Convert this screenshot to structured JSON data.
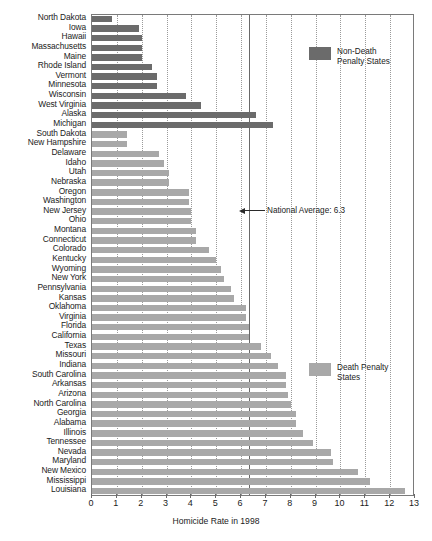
{
  "chart_data": {
    "type": "bar",
    "orientation": "horizontal",
    "title": "",
    "xlabel": "Homicide Rate in 1998",
    "ylabel": "",
    "xlim": [
      0,
      13
    ],
    "xticks": [
      0,
      1,
      2,
      3,
      4,
      5,
      6,
      7,
      8,
      9,
      10,
      11,
      12,
      13
    ],
    "grid": true,
    "legend_position": "inside-right",
    "series": [
      {
        "name": "Non-Death Penalty States",
        "color": "#6b6b6b"
      },
      {
        "name": "Death Penalty States",
        "color": "#a8a8a8"
      }
    ],
    "categories": [
      "North Dakota",
      "Iowa",
      "Hawaii",
      "Massachusetts",
      "Maine",
      "Rhode Island",
      "Vermont",
      "Minnesota",
      "Wisconsin",
      "West Virginia",
      "Alaska",
      "Michigan",
      "South Dakota",
      "New Hampshire",
      "Delaware",
      "Idaho",
      "Utah",
      "Nebraska",
      "Oregon",
      "Washington",
      "New Jersey",
      "Ohio",
      "Montana",
      "Connecticut",
      "Colorado",
      "Kentucky",
      "Wyoming",
      "New York",
      "Pennsylvania",
      "Kansas",
      "Oklahoma",
      "Virginia",
      "Florida",
      "California",
      "Texas",
      "Missouri",
      "Indiana",
      "South Carolina",
      "Arkansas",
      "Arizona",
      "North Carolina",
      "Georgia",
      "Alabama",
      "Illinois",
      "Tennessee",
      "Nevada",
      "Maryland",
      "New Mexico",
      "Mississippi",
      "Louisiana"
    ],
    "values": [
      0.8,
      1.9,
      2.0,
      2.0,
      2.0,
      2.4,
      2.6,
      2.6,
      3.8,
      4.4,
      6.6,
      7.3,
      1.4,
      1.4,
      2.7,
      2.9,
      3.1,
      3.1,
      3.9,
      3.9,
      4.0,
      4.0,
      4.2,
      4.2,
      4.7,
      5.0,
      5.2,
      5.3,
      5.6,
      5.7,
      6.2,
      6.2,
      6.3,
      6.3,
      6.8,
      7.2,
      7.5,
      7.8,
      7.8,
      7.9,
      8.0,
      8.2,
      8.2,
      8.5,
      8.9,
      9.6,
      9.7,
      10.7,
      11.2,
      12.6
    ],
    "group": [
      "non-death",
      "non-death",
      "non-death",
      "non-death",
      "non-death",
      "non-death",
      "non-death",
      "non-death",
      "non-death",
      "non-death",
      "non-death",
      "non-death",
      "death",
      "death",
      "death",
      "death",
      "death",
      "death",
      "death",
      "death",
      "death",
      "death",
      "death",
      "death",
      "death",
      "death",
      "death",
      "death",
      "death",
      "death",
      "death",
      "death",
      "death",
      "death",
      "death",
      "death",
      "death",
      "death",
      "death",
      "death",
      "death",
      "death",
      "death",
      "death",
      "death",
      "death",
      "death",
      "death",
      "death",
      "death"
    ],
    "annotations": [
      {
        "text": "National Average: 6.3",
        "value": 6.3
      }
    ]
  },
  "legend": {
    "non_death": "Non-Death\nPenalty States",
    "death": "Death Penalty\nStates"
  },
  "annotation": {
    "national_average": "National Average: 6.3"
  },
  "axis": {
    "xlabel": "Homicide Rate in 1998"
  },
  "colors": {
    "non_death": "#6b6b6b",
    "death": "#a8a8a8",
    "frame": "#7a7a7a",
    "grid": "#9a9a9a"
  }
}
